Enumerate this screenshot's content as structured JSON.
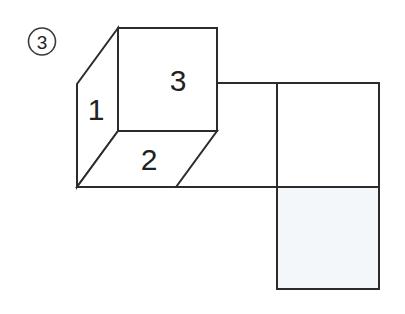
{
  "figure": {
    "problem_number": "3",
    "cube": {
      "front_face_label": "3",
      "left_face_label": "1",
      "bottom_face_label": "2"
    },
    "colors": {
      "line": "#2b2b2b",
      "background": "#ffffff",
      "shaded_square_fill": "#f3f7fa",
      "text": "#222222"
    }
  }
}
